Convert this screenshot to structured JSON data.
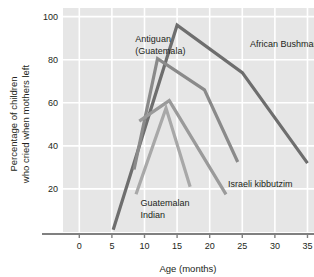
{
  "chart_data": {
    "type": "line",
    "title": "",
    "xlabel": "Age (months)",
    "ylabel": "Percentage of children who cried when mothers left",
    "ylabel_line1": "Percentage of children",
    "ylabel_line2": "who cried when mothers left",
    "xlim": [
      -2.5,
      36
    ],
    "ylim": [
      0,
      104
    ],
    "xticks": [
      0,
      5,
      10,
      15,
      20,
      25,
      30,
      35
    ],
    "xtick_labels": [
      "0",
      "5",
      "10",
      "15",
      "20",
      "25",
      "30",
      "35"
    ],
    "yticks": [
      20,
      40,
      60,
      80,
      100
    ],
    "ytick_labels": [
      "20",
      "40",
      "60",
      "80",
      "100"
    ],
    "grid": true,
    "grid_color": "#ffffff",
    "plot_bgcolor": "#e6e6e6",
    "legend_position": "inline-annotations",
    "series": [
      {
        "name": "African Bushman",
        "color": "#6e6e6e",
        "width": 3.2,
        "x": [
          5.2,
          15.0,
          25.0,
          35.0
        ],
        "y": [
          1.0,
          96.0,
          74.0,
          32.0
        ],
        "label": "African Bushman",
        "label_x": 26.2,
        "label_y": 86.0
      },
      {
        "name": "Antiguan (Guatemala)",
        "color": "#8a8a8a",
        "width": 3.2,
        "x": [
          8.4,
          12.0,
          19.2,
          24.3
        ],
        "y": [
          29.0,
          80.5,
          66.0,
          32.5
        ],
        "label_line1": "Antiguan",
        "label_line2": "(Guatemala)",
        "label_x": 8.6,
        "label_y": 88.0
      },
      {
        "name": "Israeli kibbutzim",
        "color": "#9a9a9a",
        "width": 3.2,
        "x": [
          9.2,
          13.8,
          22.5
        ],
        "y": [
          51.5,
          61.0,
          17.5
        ],
        "label": "Israeli kibbutzim",
        "label_x": 22.8,
        "label_y": 21.0
      },
      {
        "name": "Guatemalan Indian",
        "color": "#a8a8a8",
        "width": 3.2,
        "x": [
          8.7,
          13.3,
          17.0
        ],
        "y": [
          17.5,
          57.5,
          21.0
        ],
        "label_line1": "Guatemalan",
        "label_line2": "Indian",
        "label_x": 9.4,
        "label_y": 12.0
      }
    ]
  }
}
